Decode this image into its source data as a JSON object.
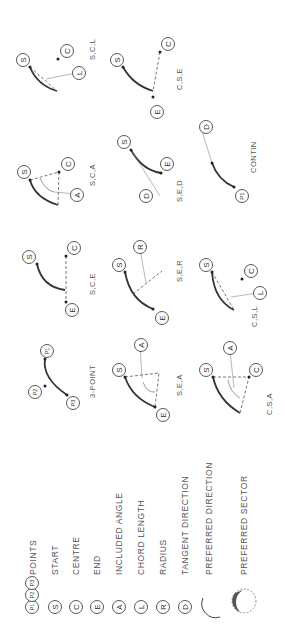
{
  "diagram": {
    "orientation": "rotated -90deg",
    "legend": [
      {
        "symbol": "P1 P2 P3",
        "label": "POINTS"
      },
      {
        "symbol": "S",
        "label": "START"
      },
      {
        "symbol": "C",
        "label": "CENTRE"
      },
      {
        "symbol": "E",
        "label": "END"
      },
      {
        "symbol": "A",
        "label": "INCLUDED ANGLE"
      },
      {
        "symbol": "L",
        "label": "CHORD LENGTH"
      },
      {
        "symbol": "R",
        "label": "RADIUS"
      },
      {
        "symbol": "D",
        "label": "TANGENT DIRECTION"
      },
      {
        "symbol": "arc",
        "label": "PREFERRED DIRECTION"
      },
      {
        "symbol": "sector",
        "label": "PREFERRED SECTOR"
      }
    ],
    "methods": [
      {
        "id": "3point",
        "caption": "3-POINT",
        "points": [
          "P1",
          "P2",
          "P3"
        ]
      },
      {
        "id": "sca",
        "caption": "S,C,A",
        "points": [
          "S",
          "C",
          "A"
        ]
      },
      {
        "id": "scl",
        "caption": "S,C,L",
        "points": [
          "S",
          "C",
          "L"
        ]
      },
      {
        "id": "sce",
        "caption": "S,C,E",
        "points": [
          "S",
          "C",
          "E"
        ]
      },
      {
        "id": "sea",
        "caption": "S,E,A",
        "points": [
          "S",
          "E",
          "A"
        ]
      },
      {
        "id": "ser",
        "caption": "S,E,R",
        "points": [
          "S",
          "E",
          "R"
        ]
      },
      {
        "id": "sed",
        "caption": "S,E,D",
        "points": [
          "S",
          "E",
          "D"
        ]
      },
      {
        "id": "cse",
        "caption": "C,S,E",
        "points": [
          "C",
          "S",
          "E"
        ]
      },
      {
        "id": "csa",
        "caption": "C,S,A",
        "points": [
          "C",
          "S",
          "A"
        ]
      },
      {
        "id": "csl",
        "caption": "C,S,L",
        "points": [
          "C",
          "S",
          "L"
        ]
      },
      {
        "id": "contin",
        "caption": "CONTIN",
        "points": [
          "P1",
          "D"
        ]
      }
    ]
  }
}
